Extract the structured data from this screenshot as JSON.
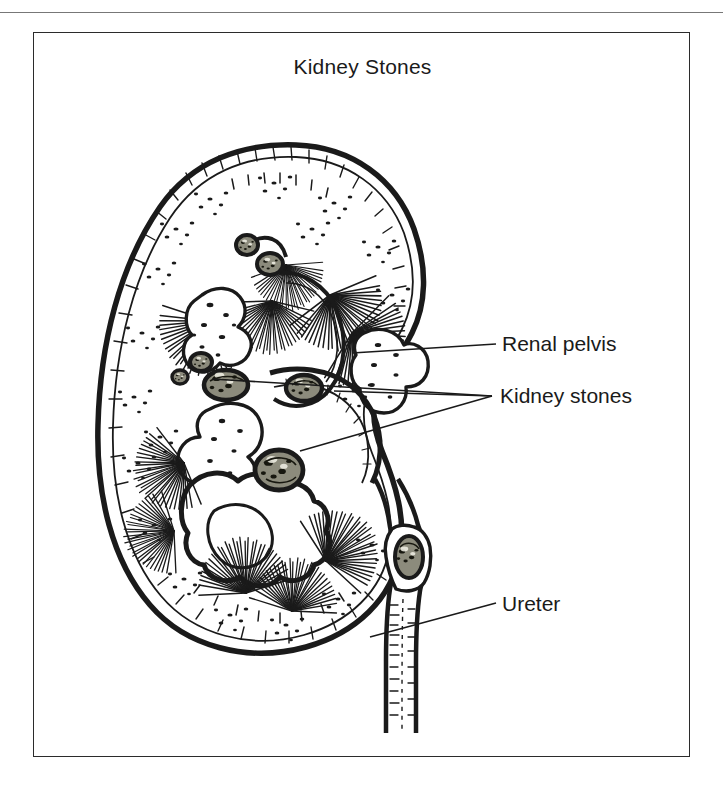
{
  "figure": {
    "title": "Kidney Stones",
    "style": "pen-and-ink engraving",
    "background_color": "#ffffff",
    "ink_color": "#1a1a1a",
    "stone_fill_color": "#8c8b7c",
    "frame": {
      "border_color": "#2b2b2b",
      "x": 33,
      "y": 32,
      "width": 657,
      "height": 725
    }
  },
  "labels": [
    {
      "id": "renal-pelvis",
      "text": "Renal pelvis",
      "x": 500,
      "y": 348,
      "leader_count": 1
    },
    {
      "id": "kidney-stones",
      "text": "Kidney stones",
      "x": 500,
      "y": 398,
      "leader_count": 3
    },
    {
      "id": "ureter",
      "text": "Ureter",
      "x": 500,
      "y": 608,
      "leader_count": 1
    }
  ],
  "anatomy": {
    "organ": "kidney",
    "view": "coronal cross-section",
    "structures": [
      "renal capsule",
      "renal cortex",
      "renal medulla",
      "renal pyramids",
      "renal columns",
      "major calyx",
      "minor calyx",
      "renal pelvis",
      "renal sinus fat",
      "ureter"
    ],
    "stones": [
      {
        "id": "stone-upper-calyx-1",
        "location": "upper minor calyx",
        "cx": 213,
        "cy": 212,
        "rx": 11,
        "ry": 10
      },
      {
        "id": "stone-upper-calyx-2",
        "location": "upper minor calyx",
        "cx": 236,
        "cy": 231,
        "rx": 13,
        "ry": 11
      },
      {
        "id": "stone-mid-small",
        "location": "renal sinus",
        "cx": 167,
        "cy": 329,
        "rx": 11,
        "ry": 9
      },
      {
        "id": "stone-mid-tiny",
        "location": "renal sinus",
        "cx": 146,
        "cy": 344,
        "rx": 8,
        "ry": 7
      },
      {
        "id": "stone-mid-large",
        "location": "renal pelvis",
        "cx": 192,
        "cy": 352,
        "rx": 22,
        "ry": 15
      },
      {
        "id": "stone-pelvis-right",
        "location": "renal pelvis",
        "cx": 270,
        "cy": 355,
        "rx": 18,
        "ry": 13
      },
      {
        "id": "stone-lower-calyx",
        "location": "lower major calyx",
        "cx": 245,
        "cy": 437,
        "rx": 24,
        "ry": 20
      },
      {
        "id": "stone-ureteric",
        "location": "proximal ureter",
        "cx": 377,
        "cy": 523,
        "rx": 14,
        "ry": 21
      }
    ],
    "stone_count": 8
  }
}
